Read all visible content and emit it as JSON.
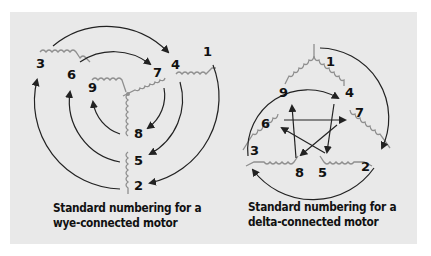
{
  "wye": {
    "caption_line1": "Standard numbering for a",
    "caption_line2": "wye-connected motor",
    "terminals": [
      "1",
      "2",
      "3",
      "4",
      "5",
      "6",
      "7",
      "8",
      "9"
    ]
  },
  "delta": {
    "caption_line1": "Standard numbering for a",
    "caption_line2": "delta-connected motor",
    "terminals": [
      "1",
      "2",
      "3",
      "4",
      "5",
      "6",
      "7",
      "8",
      "9"
    ]
  },
  "colors": {
    "background": "#e9e9e9",
    "coil": "#8f8f8f",
    "arrow": "#222222",
    "text": "#111111"
  }
}
